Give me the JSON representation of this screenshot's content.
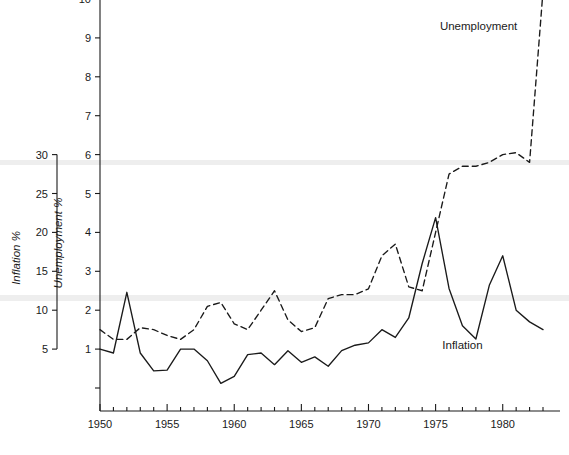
{
  "chart_data": {
    "type": "line",
    "title": "",
    "xlabel": "",
    "x": [
      1950,
      1951,
      1952,
      1953,
      1954,
      1955,
      1956,
      1957,
      1958,
      1959,
      1960,
      1961,
      1962,
      1963,
      1964,
      1965,
      1966,
      1967,
      1968,
      1969,
      1970,
      1971,
      1972,
      1973,
      1974,
      1975,
      1976,
      1977,
      1978,
      1979,
      1980,
      1981,
      1982,
      1983
    ],
    "xlim": [
      1950,
      1983
    ],
    "xticks_major": [
      1950,
      1955,
      1960,
      1965,
      1970,
      1975,
      1980
    ],
    "xtick_labels": [
      "1950",
      "1955",
      "1960",
      "1965",
      "1970",
      "1975",
      "1980"
    ],
    "xticks_minor_step": 1,
    "grid": false,
    "legend_position": "inline-annotations",
    "axes": [
      {
        "id": "inflation-axis",
        "side": "left",
        "label": "Inflation %",
        "ylim": [
          0,
          30
        ],
        "ticks": [
          5,
          10,
          15,
          20,
          25,
          30
        ],
        "tick_labels": [
          "5",
          "10",
          "15",
          "20",
          "25",
          "30"
        ]
      },
      {
        "id": "unemployment-axis",
        "side": "left-inner",
        "label": "Unemployment %",
        "ylim": [
          0,
          10.4
        ],
        "ticks": [
          1,
          2,
          3,
          4,
          5,
          6,
          7,
          8,
          9,
          10
        ],
        "tick_labels": [
          "1",
          "2",
          "3",
          "4",
          "5",
          "6",
          "7",
          "8",
          "9",
          "10"
        ]
      }
    ],
    "series": [
      {
        "name": "Inflation",
        "axis": "inflation-axis",
        "style": "solid",
        "color": "#1a1a1a",
        "unit": "%",
        "label_position": {
          "x": 1977.0,
          "y": 5.0
        },
        "values": [
          5.0,
          4.5,
          12.3,
          4.5,
          2.2,
          2.3,
          5.0,
          5.0,
          3.5,
          0.6,
          1.5,
          4.3,
          4.5,
          3.0,
          4.8,
          3.3,
          4.0,
          2.8,
          4.8,
          5.5,
          5.8,
          7.5,
          6.5,
          9.0,
          16.0,
          21.9,
          12.8,
          8.0,
          6.3,
          13.2,
          17.0,
          10.0,
          8.5,
          7.5
        ]
      },
      {
        "name": "Unemployment",
        "axis": "unemployment-axis",
        "style": "dashed",
        "color": "#1a1a1a",
        "unit": "%",
        "label_position": {
          "x": 1978.2,
          "y": 9.2
        },
        "values": [
          1.5,
          1.25,
          1.25,
          1.55,
          1.5,
          1.35,
          1.25,
          1.5,
          2.1,
          2.2,
          1.65,
          1.5,
          2.0,
          2.5,
          1.75,
          1.45,
          1.55,
          2.3,
          2.4,
          2.4,
          2.55,
          3.4,
          3.7,
          2.6,
          2.5,
          4.0,
          5.5,
          5.7,
          5.7,
          5.8,
          6.0,
          6.05,
          5.8,
          10.2
        ]
      }
    ],
    "annotations": [
      {
        "text": "Unemployment",
        "x": 1978.2,
        "y": 9.2,
        "series": "Unemployment"
      },
      {
        "text": "Inflation",
        "x": 1977.0,
        "y": 5.0,
        "series": "Inflation"
      }
    ]
  }
}
